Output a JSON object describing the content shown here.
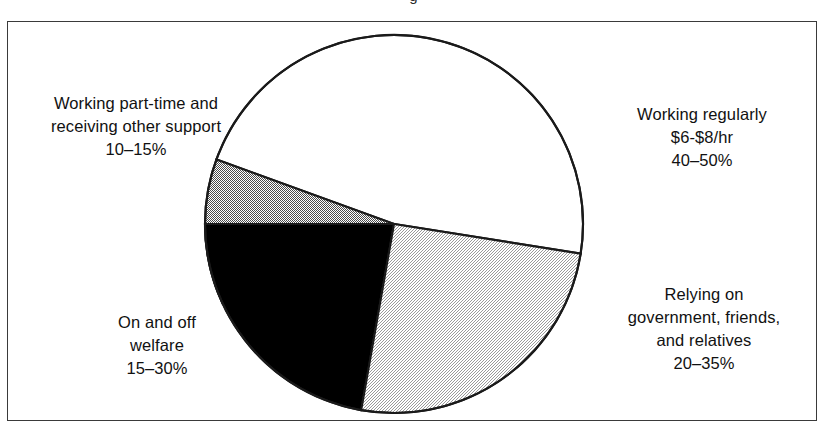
{
  "figure": {
    "title_sliver": "g",
    "border_color": "#3a3a3a",
    "background": "#ffffff"
  },
  "chart_data": {
    "type": "pie",
    "title": "",
    "xlabel": "",
    "ylabel": "",
    "legend_position": "none",
    "grid": false,
    "labels_outside": true,
    "total_note": "Ranges overlap; shares are approximate bands, not exact percentages.",
    "categories": [
      "Working regularly $6-$8/hr",
      "Relying on government, friends, and relatives",
      "On and off welfare",
      "Working part-time and receiving other support"
    ],
    "values": [
      45,
      27.5,
      22.5,
      12.5
    ],
    "value_ranges": [
      [
        40,
        50
      ],
      [
        20,
        35
      ],
      [
        15,
        30
      ],
      [
        10,
        15
      ]
    ],
    "slices": [
      {
        "id": "working-regularly",
        "name": "Working regularly",
        "detail": "$6-$8/hr",
        "range_label": "40–50%",
        "low": 40,
        "high": 50,
        "value": 45,
        "fill": "#ffffff",
        "fill_name": "white",
        "start_angle_deg": -9,
        "end_angle_deg": 160,
        "sweep_deg": 169
      },
      {
        "id": "working-part-time",
        "name": "Working part-time and",
        "detail": "receiving other support",
        "range_label": "10–15%",
        "low": 10,
        "high": 15,
        "value": 12.5,
        "fill": "#8a8a8a",
        "fill_name": "medium-gray",
        "start_angle_deg": 160,
        "end_angle_deg": 180,
        "sweep_deg": 45
      },
      {
        "id": "on-and-off-welfare",
        "name": "On and off",
        "detail": "welfare",
        "range_label": "15–30%",
        "low": 15,
        "high": 30,
        "value": 22.5,
        "fill": "#000000",
        "fill_name": "black",
        "start_angle_deg": 180,
        "end_angle_deg": 260,
        "sweep_deg": 80
      },
      {
        "id": "relying-on-support",
        "name": "Relying on",
        "detail": "government, friends, and relatives",
        "range_label": "20–35%",
        "low": 20,
        "high": 35,
        "value": 27.5,
        "fill": "#d9d9d9",
        "fill_name": "light-gray",
        "start_angle_deg": 260,
        "end_angle_deg": 351,
        "sweep_deg": 91
      }
    ]
  },
  "labels": {
    "part_time": {
      "line1": "Working part-time and",
      "line2": "receiving other support",
      "line3": "10–15%"
    },
    "working_regularly": {
      "line1": "Working regularly",
      "line2": "$6-$8/hr",
      "line3": "40–50%"
    },
    "relying": {
      "line1": "Relying on",
      "line2": "government, friends,",
      "line3": "and relatives",
      "line4": "20–35%"
    },
    "welfare": {
      "line1": "On and off",
      "line2": "welfare",
      "line3": "15–30%"
    }
  }
}
